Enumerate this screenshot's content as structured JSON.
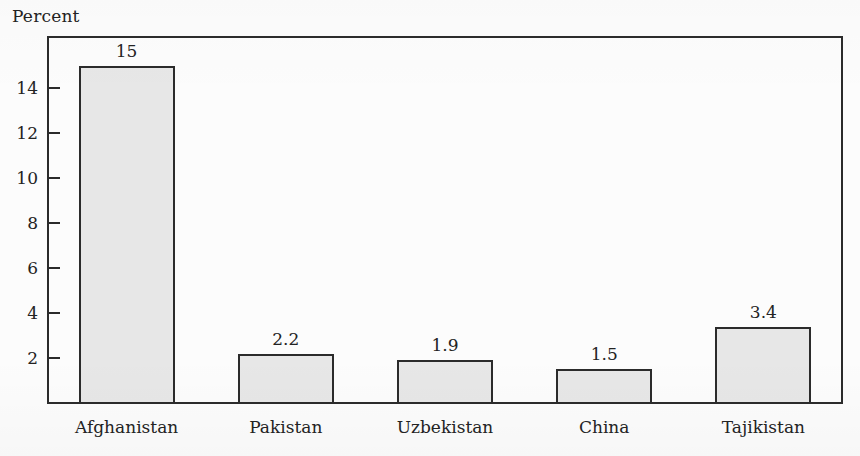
{
  "figure": {
    "y_axis_caption": "Percent"
  },
  "chart_data": {
    "type": "bar",
    "title": "",
    "xlabel": "",
    "ylabel": "Percent",
    "categories": [
      "Afghanistan",
      "Pakistan",
      "Uzbekistan",
      "China",
      "Tajikistan"
    ],
    "values": [
      15,
      2.2,
      1.9,
      1.5,
      3.4
    ],
    "value_labels": [
      "15",
      "2.2",
      "1.9",
      "1.5",
      "3.4"
    ],
    "ylim": [
      0,
      16
    ],
    "yticks": [
      2,
      4,
      6,
      8,
      10,
      12,
      14
    ],
    "ytick_labels": [
      "2",
      "4",
      "6",
      "8",
      "10",
      "12",
      "14"
    ],
    "grid": false,
    "legend": false,
    "bar_fill": "#e7e7e7",
    "bar_stroke": "#2b2b2b",
    "background": "#fcfcfc",
    "text_color": "#232323"
  }
}
